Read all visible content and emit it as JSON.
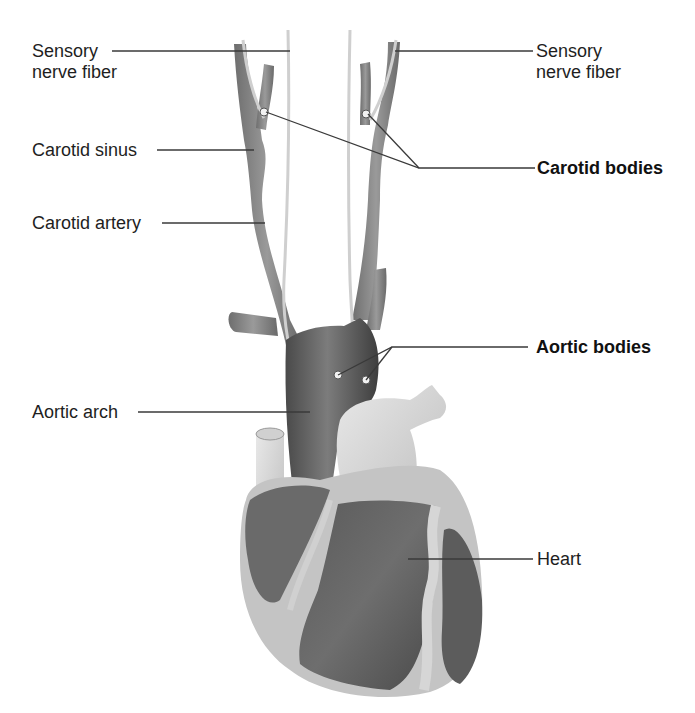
{
  "figure": {
    "type": "anatomical-diagram",
    "colors": {
      "background": "#ffffff",
      "leader_line": "#3a3a3a",
      "vessel_dark": "#5a5a5a",
      "vessel_mid": "#8a8a8a",
      "tissue_light": "#d8d8d8",
      "label_text": "#1e1e1e"
    }
  },
  "labels": {
    "sensory_left_line1": "Sensory",
    "sensory_left_line2": "nerve fiber",
    "sensory_right_line1": "Sensory",
    "sensory_right_line2": "nerve fiber",
    "carotid_sinus": "Carotid sinus",
    "carotid_artery": "Carotid artery",
    "carotid_bodies": "Carotid bodies",
    "aortic_bodies": "Aortic bodies",
    "aortic_arch": "Aortic arch",
    "heart": "Heart"
  }
}
